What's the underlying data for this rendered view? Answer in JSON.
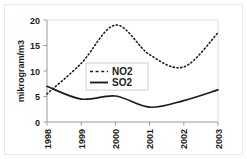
{
  "chart_data": {
    "type": "line",
    "title": "",
    "xlabel": "",
    "ylabel": "mikrogram/m3",
    "categories": [
      "1998",
      "1999",
      "2000",
      "2001",
      "2002",
      "2003"
    ],
    "x": [
      1998,
      1999,
      2000,
      2001,
      2002,
      2003
    ],
    "xlim": [
      1998,
      2003
    ],
    "ylim": [
      0,
      20
    ],
    "yticks": [
      0,
      5,
      10,
      15,
      20
    ],
    "ytick_labels": [
      "0",
      "5",
      "10",
      "15",
      "20"
    ],
    "xtick_labels": [
      "1998",
      "1999",
      "2000",
      "2001",
      "2002",
      "2003"
    ],
    "xtick_rotation": 90,
    "grid": false,
    "legend_position": "center-left",
    "series": [
      {
        "name": "NO2",
        "style": "dotted",
        "color": "#1d1d1d",
        "values": [
          5.5,
          11.5,
          19.0,
          13.2,
          10.8,
          17.5
        ]
      },
      {
        "name": "SO2",
        "style": "solid",
        "color": "#1d1d1d",
        "values": [
          7.0,
          4.5,
          5.1,
          2.9,
          4.2,
          6.3
        ]
      }
    ]
  },
  "legend": {
    "entries": [
      {
        "label": "NO2",
        "style": "dotted"
      },
      {
        "label": "SO2",
        "style": "solid"
      }
    ]
  },
  "axes": {
    "y_axis_title": "mikrogram/m3",
    "y_tick_0": "0",
    "y_tick_1": "5",
    "y_tick_2": "10",
    "y_tick_3": "15",
    "y_tick_4": "20",
    "x_tick_0": "1998",
    "x_tick_1": "1999",
    "x_tick_2": "2000",
    "x_tick_3": "2001",
    "x_tick_4": "2002",
    "x_tick_5": "2003"
  },
  "colors": {
    "line": "#1d1d1d",
    "axis": "#999999",
    "background": "#ffffff",
    "legend_border": "#cfcfcf"
  }
}
